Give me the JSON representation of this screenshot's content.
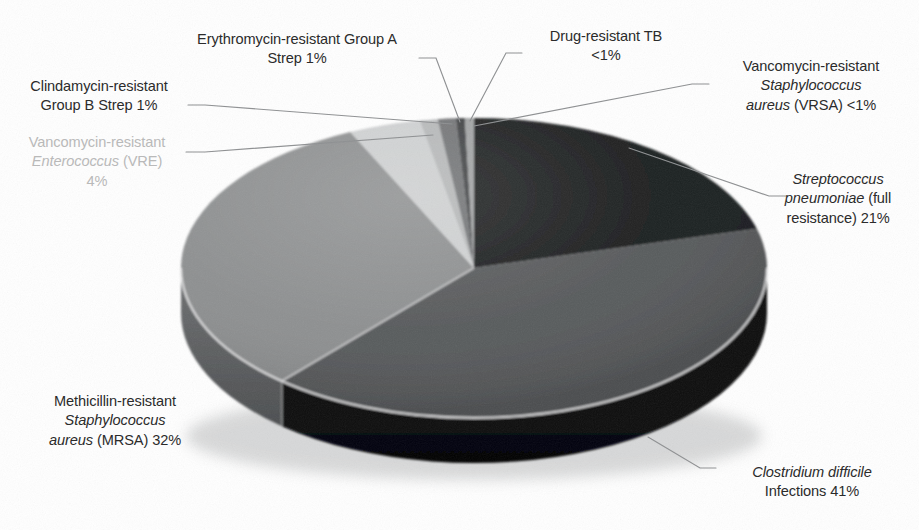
{
  "chart_data": {
    "type": "pie",
    "title": "",
    "subtitle": "",
    "xlabel": "",
    "ylabel": "",
    "legend_position": "none",
    "grid": false,
    "three_d": true,
    "categories": [
      "Streptococcus pneumoniae (full resistance)",
      "Clostridium difficile Infections",
      "Methicillin-resistant Staphylococcus aureus (MRSA)",
      "Vancomycin-resistant Enterococcus (VRE)",
      "Clindamycin-resistant Group B Strep",
      "Erythromycin-resistant Group A Strep",
      "Drug-resistant TB",
      "Vancomycin-resistant Staphylococcus aureus (VRSA)"
    ],
    "values": [
      21,
      41,
      32,
      4,
      1,
      1,
      0.5,
      0.5
    ],
    "value_labels": [
      "21%",
      "41%",
      "32%",
      "4%",
      "1%",
      "1%",
      "<1%",
      "<1%"
    ],
    "colors": [
      "#17191a",
      "#545658",
      "#8b8d8e",
      "#cdcfd0",
      "#b4b6b7",
      "#6e7072",
      "#3c3e40",
      "#9ea0a1"
    ],
    "slice_start_angles_deg": [
      0,
      75.6,
      223.2,
      338.4,
      352.8,
      356.4,
      358.2,
      359.1
    ],
    "total": 100,
    "units": "percent of drug-resistant infections"
  },
  "labels": {
    "erythromycin": {
      "line1": "Erythromycin-resistant Group A",
      "line2": "Strep 1%"
    },
    "clindamycin": {
      "line1": "Clindamycin-resistant",
      "line2": "Group B Strep 1%"
    },
    "vre": {
      "line1": "Vancomycin-resistant",
      "line2_italic": "Enterococcus",
      "line2_rest": " (VRE)",
      "line3": "4%"
    },
    "tb": {
      "line1": "Drug-resistant TB",
      "line2": "<1%"
    },
    "vrsa": {
      "line1": "Vancomycin-resistant",
      "line2_italic": "Staphylococcus",
      "line3_italic": "aureus",
      "line3_rest": " (VRSA) <1%"
    },
    "pneumo": {
      "line1_italic": "Streptococcus",
      "line2_italic": "pneumoniae",
      "line2_rest": " (full",
      "line3": "resistance) 21%"
    },
    "mrsa": {
      "line1": "Methicillin-resistant",
      "line2_italic": "Staphylococcus",
      "line3_italic": "aureus",
      "line3_rest": " (MRSA) 32%"
    },
    "cdiff": {
      "line1_italic": "Clostridium difficile",
      "line2": "Infections 41%"
    }
  },
  "style": {
    "label_color": "#2b2b2b",
    "faded_label_color": "#b9b9b9",
    "leader_color": "#8e9092",
    "background": "#ffffff"
  }
}
